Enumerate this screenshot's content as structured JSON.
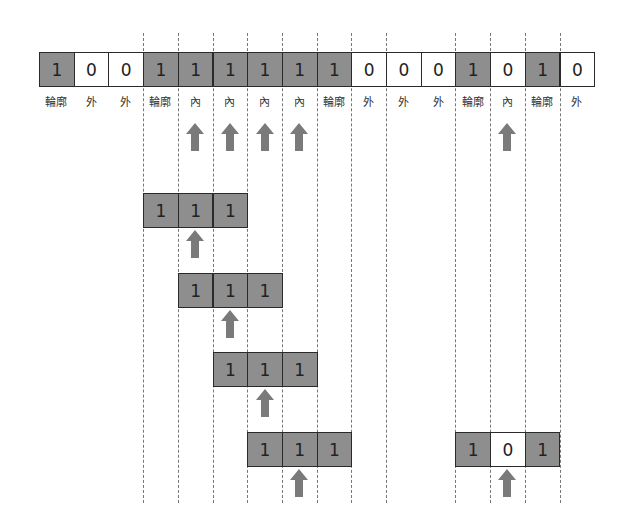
{
  "diagram": {
    "main_row": {
      "cells": [
        {
          "value": "1",
          "state": "on",
          "label": "輪廓"
        },
        {
          "value": "0",
          "state": "off",
          "label": "外"
        },
        {
          "value": "0",
          "state": "off",
          "label": "外"
        },
        {
          "value": "1",
          "state": "on",
          "label": "輪廓"
        },
        {
          "value": "1",
          "state": "on",
          "label": "內"
        },
        {
          "value": "1",
          "state": "on",
          "label": "內"
        },
        {
          "value": "1",
          "state": "on",
          "label": "內"
        },
        {
          "value": "1",
          "state": "on",
          "label": "內"
        },
        {
          "value": "1",
          "state": "on",
          "label": "輪廓"
        },
        {
          "value": "0",
          "state": "off",
          "label": "外"
        },
        {
          "value": "0",
          "state": "off",
          "label": "外"
        },
        {
          "value": "0",
          "state": "off",
          "label": "外"
        },
        {
          "value": "1",
          "state": "on",
          "label": "輪廓"
        },
        {
          "value": "0",
          "state": "off",
          "label": "內"
        },
        {
          "value": "1",
          "state": "on",
          "label": "輪廓"
        },
        {
          "value": "0",
          "state": "off",
          "label": "外"
        }
      ],
      "arrow_indices": [
        4,
        5,
        6,
        7,
        13
      ]
    },
    "windows": [
      {
        "start": 3,
        "top": 193,
        "cells": [
          {
            "value": "1",
            "state": "on"
          },
          {
            "value": "1",
            "state": "on"
          },
          {
            "value": "1",
            "state": "on"
          }
        ]
      },
      {
        "start": 4,
        "top": 273,
        "cells": [
          {
            "value": "1",
            "state": "on"
          },
          {
            "value": "1",
            "state": "on"
          },
          {
            "value": "1",
            "state": "on"
          }
        ]
      },
      {
        "start": 5,
        "top": 352,
        "cells": [
          {
            "value": "1",
            "state": "on"
          },
          {
            "value": "1",
            "state": "on"
          },
          {
            "value": "1",
            "state": "on"
          }
        ]
      },
      {
        "start": 6,
        "top": 432,
        "cells": [
          {
            "value": "1",
            "state": "on"
          },
          {
            "value": "1",
            "state": "on"
          },
          {
            "value": "1",
            "state": "on"
          }
        ]
      },
      {
        "start": 12,
        "top": 432,
        "cells": [
          {
            "value": "1",
            "state": "on"
          },
          {
            "value": "0",
            "state": "off"
          },
          {
            "value": "1",
            "state": "on"
          }
        ]
      }
    ],
    "dotted_line_boundaries": [
      3,
      4,
      5,
      6,
      7,
      8,
      9,
      10,
      12,
      13,
      14,
      15
    ],
    "colors": {
      "filled": "#8e8e8e",
      "empty": "#ffffff",
      "arrow": "#7a7a7a",
      "border": "#2a2a2a"
    }
  }
}
